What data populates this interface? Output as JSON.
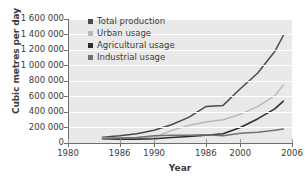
{
  "chart_data": {
    "type": "line",
    "title": "",
    "xlabel": "Year",
    "ylabel": "Cubic metres per day",
    "xlim": [
      1980,
      2006
    ],
    "ylim": [
      0,
      1600000
    ],
    "grid": "horizontal",
    "legend_position": "top-left-inside",
    "x_tick_labels": [
      "1980",
      "1986",
      "1990",
      "1986",
      "2000",
      "2006"
    ],
    "x_tick_values": [
      1980,
      1986,
      1990,
      1996,
      2000,
      2006
    ],
    "y_tick_labels": [
      "0",
      "200 000",
      "400 000",
      "600 000",
      "800 000",
      "1 000 000",
      "1 200 000",
      "1 400 000",
      "1 600 000"
    ],
    "y_tick_values": [
      0,
      200000,
      400000,
      600000,
      800000,
      1000000,
      1200000,
      1400000,
      1600000
    ],
    "x": [
      1984,
      1986,
      1988,
      1990,
      1992,
      1994,
      1996,
      1998,
      2000,
      2002,
      2004,
      2005
    ],
    "series": [
      {
        "name": "Total production",
        "color": "#4a4a4a",
        "values": [
          75000,
          95000,
          120000,
          165000,
          235000,
          330000,
          470000,
          485000,
          700000,
          900000,
          1180000,
          1390000
        ]
      },
      {
        "name": "Urban usage",
        "color": "#b9b9b9",
        "values": [
          70000,
          60000,
          55000,
          75000,
          160000,
          225000,
          270000,
          300000,
          370000,
          470000,
          610000,
          750000
        ]
      },
      {
        "name": "Agricultural usage",
        "color": "#2e2e2e",
        "values": [
          55000,
          50000,
          48000,
          55000,
          70000,
          85000,
          100000,
          120000,
          200000,
          310000,
          440000,
          540000
        ]
      },
      {
        "name": "Industrial usage",
        "color": "#717171",
        "values": [
          60000,
          65000,
          70000,
          95000,
          100000,
          100000,
          105000,
          95000,
          125000,
          140000,
          165000,
          180000
        ]
      }
    ]
  },
  "legend": {
    "items": [
      {
        "label": "Total production",
        "color": "#4a4a4a"
      },
      {
        "label": "Urban usage",
        "color": "#b9b9b9"
      },
      {
        "label": "Agricultural usage",
        "color": "#2e2e2e"
      },
      {
        "label": "Industrial usage",
        "color": "#717171"
      }
    ]
  },
  "axes": {
    "y_title": "Cubic metres per day",
    "x_title": "Year"
  }
}
